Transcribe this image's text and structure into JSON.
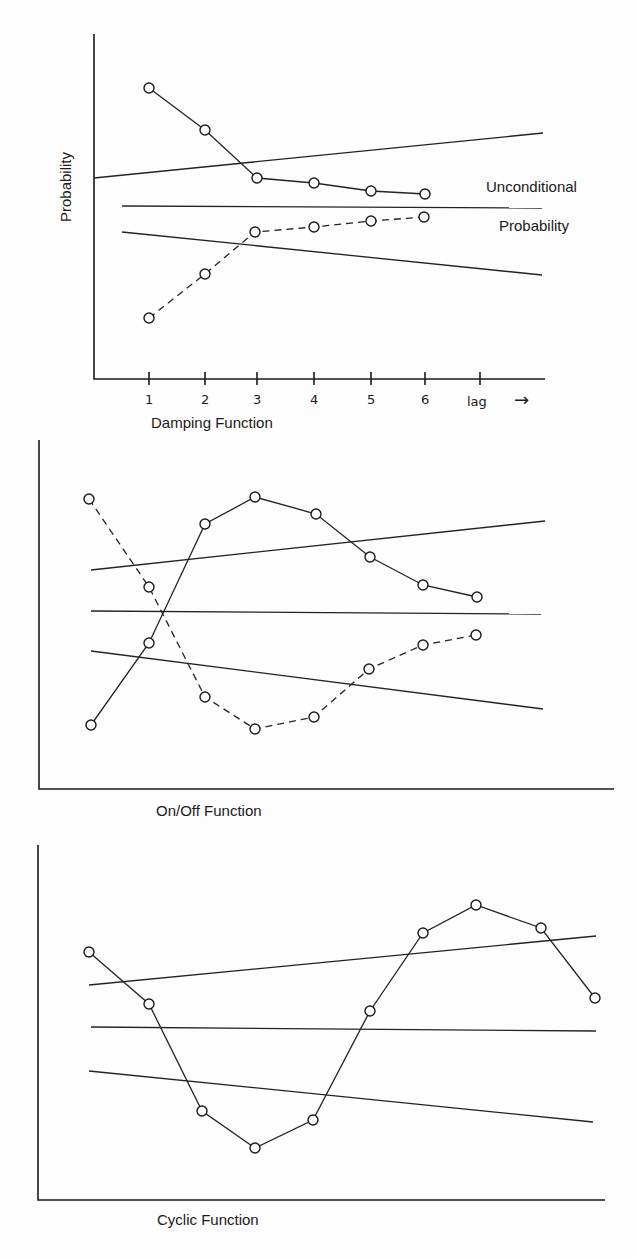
{
  "chart_data": [
    {
      "type": "line",
      "title": "Damping Function",
      "ylabel": "Probability",
      "xlabel": "lag",
      "categories": [
        "1",
        "2",
        "3",
        "4",
        "5",
        "6",
        "lag"
      ],
      "annotations": [
        "Unconditional",
        "Probability"
      ],
      "axis": {
        "x0": 94,
        "y0": 379,
        "x1": 545,
        "ytop": 34
      },
      "ticks_x": [
        149,
        205,
        257,
        314,
        371,
        425,
        480
      ],
      "reference_lines": [
        {
          "name": "upper-bound",
          "points": [
            [
              94,
              178
            ],
            [
              543,
              133
            ]
          ]
        },
        {
          "name": "unconditional-probability",
          "points": [
            [
              122,
              206
            ],
            [
              542,
              208
            ]
          ]
        },
        {
          "name": "lower-bound",
          "points": [
            [
              122,
              232
            ],
            [
              542,
              275
            ]
          ]
        }
      ],
      "series": [
        {
          "name": "above",
          "style": "solid",
          "points": [
            [
              149,
              88
            ],
            [
              205,
              130
            ],
            [
              257,
              178
            ],
            [
              314,
              183
            ],
            [
              371,
              191
            ],
            [
              425,
              194
            ]
          ]
        },
        {
          "name": "below",
          "style": "dashed",
          "points": [
            [
              149,
              318
            ],
            [
              205,
              274
            ],
            [
              255,
              232
            ],
            [
              314,
              227
            ],
            [
              371,
              221
            ],
            [
              424,
              217
            ]
          ]
        }
      ],
      "label_pos": {
        "title": [
          151,
          428
        ],
        "ylabel": [
          66,
          178
        ],
        "ann1": [
          486,
          192
        ],
        "ann2": [
          499,
          231
        ],
        "arrow": [
          516,
          540,
          402
        ]
      }
    },
    {
      "type": "line",
      "title": "On/Off Function",
      "axis": {
        "x0": 39,
        "y0": 789,
        "x1": 614,
        "ytop": 440
      },
      "reference_lines": [
        {
          "name": "upper-bound",
          "points": [
            [
              91,
              570
            ],
            [
              545,
              521
            ]
          ]
        },
        {
          "name": "unconditional-probability",
          "points": [
            [
              91,
              611
            ],
            [
              541,
              614
            ]
          ]
        },
        {
          "name": "lower-bound",
          "points": [
            [
              91,
              651
            ],
            [
              543,
              709
            ]
          ]
        }
      ],
      "series": [
        {
          "name": "on-off-solid",
          "style": "solid",
          "points": [
            [
              91,
              725
            ],
            [
              149,
              643
            ],
            [
              205,
              524
            ],
            [
              255,
              497
            ],
            [
              316,
              514
            ],
            [
              370,
              557
            ],
            [
              423,
              585
            ],
            [
              477,
              597
            ]
          ]
        },
        {
          "name": "on-off-dashed",
          "style": "dashed",
          "points": [
            [
              89,
              499
            ],
            [
              149,
              587
            ],
            [
              205,
              697
            ],
            [
              255,
              729
            ],
            [
              314,
              717
            ],
            [
              369,
              669
            ],
            [
              423,
              645
            ],
            [
              476,
              635
            ]
          ]
        }
      ],
      "label_pos": {
        "title": [
          156,
          816
        ]
      }
    },
    {
      "type": "line",
      "title": "Cyclic Function",
      "axis": {
        "x0": 38,
        "y0": 1200,
        "x1": 605,
        "ytop": 845
      },
      "reference_lines": [
        {
          "name": "upper-bound",
          "points": [
            [
              89,
              985
            ],
            [
              596,
              936
            ]
          ]
        },
        {
          "name": "unconditional-probability",
          "points": [
            [
              91,
              1027
            ],
            [
              596,
              1031
            ]
          ]
        },
        {
          "name": "lower-bound",
          "points": [
            [
              89,
              1071
            ],
            [
              593,
              1122
            ]
          ]
        }
      ],
      "series": [
        {
          "name": "cyclic",
          "style": "solid",
          "points": [
            [
              89,
              952
            ],
            [
              149,
              1004
            ],
            [
              202,
              1111
            ],
            [
              255,
              1148
            ],
            [
              313,
              1120
            ],
            [
              370,
              1011
            ],
            [
              423,
              933
            ],
            [
              476,
              905
            ],
            [
              541,
              928
            ],
            [
              595,
              998
            ]
          ]
        }
      ],
      "label_pos": {
        "title": [
          157,
          1225
        ]
      }
    }
  ],
  "labels": {
    "top_title": "Damping Function",
    "top_ylabel": "Probability",
    "top_annotation_1": "Unconditional",
    "top_annotation_2": "Probability",
    "top_lag": "lag",
    "top_arrow": "→",
    "mid_title": "On/Off Function",
    "bot_title": "Cyclic Function",
    "ticks": [
      "1",
      "2",
      "3",
      "4",
      "5",
      "6"
    ]
  }
}
